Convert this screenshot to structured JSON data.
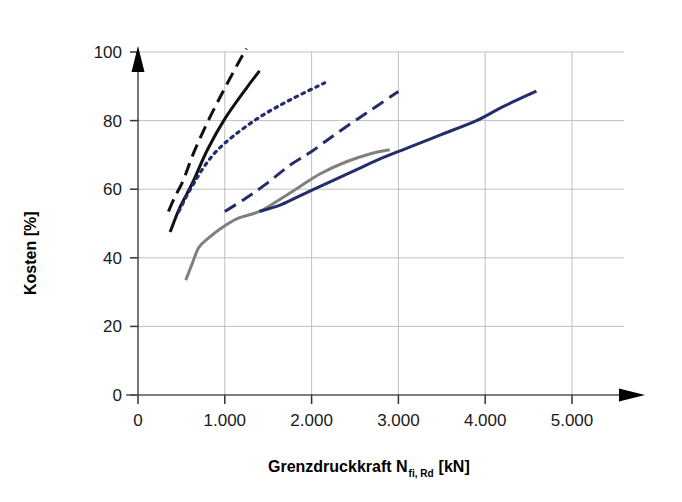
{
  "chart_data": {
    "type": "line",
    "title": "",
    "xlabel": "Grenzdruckkraft N",
    "xlabel_sub": "fi, Rd",
    "xlabel_unit": "[kN]",
    "ylabel": "Kosten [%]",
    "xlim": [
      0,
      5600
    ],
    "ylim": [
      0,
      105
    ],
    "grid": true,
    "legend": "none",
    "xticks": [
      0,
      1000,
      2000,
      3000,
      4000,
      5000
    ],
    "xticklabels": [
      "0",
      "1.000",
      "2.000",
      "3.000",
      "4.000",
      "5.000"
    ],
    "yticks": [
      0,
      20,
      40,
      60,
      80,
      100
    ],
    "yticklabels": [
      "0",
      "20",
      "40",
      "60",
      "80",
      "100"
    ],
    "colors": {
      "black": "#111111",
      "navy": "#232d6b",
      "grey": "#808080"
    },
    "series": [
      {
        "name": "black-dashed",
        "color": "#111111",
        "style": "dashed",
        "points": [
          [
            350,
            53.5
          ],
          [
            430,
            58.0
          ],
          [
            520,
            62.5
          ],
          [
            640,
            70.5
          ],
          [
            800,
            79.5
          ],
          [
            980,
            88.5
          ],
          [
            1160,
            97.0
          ],
          [
            1250,
            101.0
          ]
        ]
      },
      {
        "name": "black-solid",
        "color": "#111111",
        "style": "solid",
        "points": [
          [
            370,
            47.5
          ],
          [
            470,
            54.0
          ],
          [
            560,
            58.5
          ],
          [
            640,
            62.5
          ],
          [
            800,
            71.5
          ],
          [
            1000,
            80.5
          ],
          [
            1250,
            89.5
          ],
          [
            1400,
            94.5
          ]
        ]
      },
      {
        "name": "navy-dotted",
        "color": "#232d6b",
        "style": "dotted",
        "points": [
          [
            470,
            53.5
          ],
          [
            560,
            58.0
          ],
          [
            650,
            62.0
          ],
          [
            760,
            66.5
          ],
          [
            900,
            71.0
          ],
          [
            1100,
            75.5
          ],
          [
            1400,
            81.0
          ],
          [
            1750,
            86.0
          ],
          [
            2150,
            91.0
          ]
        ]
      },
      {
        "name": "navy-dashed",
        "color": "#232d6b",
        "style": "dashed",
        "points": [
          [
            1000,
            53.5
          ],
          [
            1250,
            57.5
          ],
          [
            1500,
            62.0
          ],
          [
            1750,
            67.0
          ],
          [
            2000,
            71.0
          ],
          [
            2300,
            76.5
          ],
          [
            2650,
            82.5
          ],
          [
            3000,
            88.5
          ]
        ]
      },
      {
        "name": "grey-solid",
        "color": "#808080",
        "style": "solid",
        "points": [
          [
            550,
            33.5
          ],
          [
            620,
            38.0
          ],
          [
            700,
            43.0
          ],
          [
            800,
            45.5
          ],
          [
            950,
            48.5
          ],
          [
            1150,
            51.5
          ],
          [
            1400,
            53.5
          ],
          [
            1600,
            56.5
          ],
          [
            1850,
            60.5
          ],
          [
            2100,
            64.5
          ],
          [
            2400,
            68.0
          ],
          [
            2700,
            70.5
          ],
          [
            2900,
            71.5
          ]
        ]
      },
      {
        "name": "navy-solid",
        "color": "#232d6b",
        "style": "solid",
        "points": [
          [
            1400,
            53.5
          ],
          [
            1650,
            55.5
          ],
          [
            1900,
            58.5
          ],
          [
            2200,
            62.0
          ],
          [
            2500,
            65.5
          ],
          [
            2800,
            69.0
          ],
          [
            3100,
            72.0
          ],
          [
            3500,
            76.0
          ],
          [
            3900,
            80.0
          ],
          [
            4200,
            84.0
          ],
          [
            4590,
            88.6
          ]
        ]
      }
    ]
  }
}
